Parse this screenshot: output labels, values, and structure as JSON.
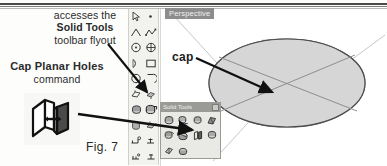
{
  "figure": {
    "caption": "Fig. 7"
  },
  "annotations": {
    "accesses": {
      "line1": "accesses the",
      "line2": "Solid Tools",
      "line3": "toolbar flyout"
    },
    "cap_command": {
      "line1": "Cap Planar Holes",
      "line2": "command"
    },
    "cap_callout": "cap"
  },
  "viewport": {
    "view_tab_label": "Perspective",
    "model": {
      "name": "capped-cylinder",
      "cap_face_color": "#d4d4d4",
      "side_color": "#9a9a9a"
    }
  },
  "flyout": {
    "title": "Solid Tools",
    "close_button_label": "",
    "tools": [
      {
        "name": "outer-shell-tool",
        "row": 1,
        "col": 1
      },
      {
        "name": "intersect-tool",
        "row": 1,
        "col": 2
      },
      {
        "name": "union-tool",
        "row": 1,
        "col": 3
      },
      {
        "name": "subtract-tool",
        "row": 1,
        "col": 4
      },
      {
        "name": "trim-tool",
        "row": 2,
        "col": 1
      },
      {
        "name": "split-tool",
        "row": 2,
        "col": 2
      },
      {
        "name": "cap-planar-holes-tool",
        "row": 2,
        "col": 3
      },
      {
        "name": "solid-inspector-tool",
        "row": 2,
        "col": 4
      },
      {
        "name": "extra-tool-a",
        "row": 3,
        "col": 1
      },
      {
        "name": "extra-tool-b",
        "row": 3,
        "col": 2
      }
    ]
  },
  "toolbar": {
    "name": "large-tool-set",
    "columns": 2,
    "items": [
      {
        "name": "select-arrow-tool"
      },
      {
        "name": "paint-bucket-tool"
      },
      {
        "name": "line-tool"
      },
      {
        "name": "freehand-tool"
      },
      {
        "name": "circle-tool"
      },
      {
        "name": "polygon-tool"
      },
      {
        "name": "arc-tool"
      },
      {
        "name": "rectangle-tool"
      },
      {
        "name": "pie-tool"
      },
      {
        "name": "bezier-tool"
      },
      {
        "name": "move-tool"
      },
      {
        "name": "push-pull-tool"
      },
      {
        "name": "rotate-tool"
      },
      {
        "name": "follow-me-tool"
      },
      {
        "name": "scale-tool"
      },
      {
        "name": "offset-tool"
      },
      {
        "name": "tape-measure-tool"
      },
      {
        "name": "dimension-tool"
      },
      {
        "name": "protractor-tool"
      },
      {
        "name": "text-tool"
      },
      {
        "name": "axes-tool"
      },
      {
        "name": "3d-text-tool"
      }
    ],
    "highlighted_item": "solid-tools-flyout-button"
  },
  "colors": {
    "ink": "#2b2b2b",
    "toolbar_bg": "#f2f2ef",
    "flyout_bg": "#e9e9e6",
    "title_bar": "#9a9a96",
    "tab_bg": "#8d8d8d"
  }
}
